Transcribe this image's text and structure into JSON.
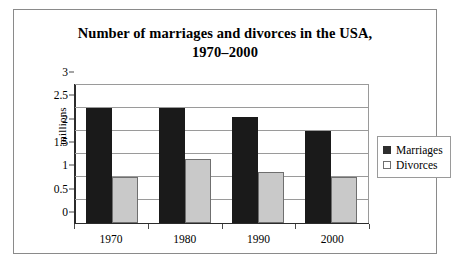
{
  "chart_data": {
    "type": "bar",
    "title": "Number of marriages and divorces in the USA, 1970–2000",
    "title_lines": [
      "Number of marriages and divorces in the USA,",
      "1970–2000"
    ],
    "categories": [
      "1970",
      "1980",
      "1990",
      "2000"
    ],
    "series": [
      {
        "name": "Marriages",
        "values": [
          2.5,
          2.5,
          2.3,
          2.0
        ],
        "color": "#1a1a1a"
      },
      {
        "name": "Divorces",
        "values": [
          1.0,
          1.4,
          1.1,
          1.0
        ],
        "color": "#c9c9c9"
      }
    ],
    "xlabel": "",
    "ylabel": "millions",
    "ylim": [
      0,
      3
    ],
    "yticks": [
      "0",
      "0.5",
      "1",
      "1.5",
      "2",
      "2.5",
      "3"
    ],
    "ytick_values": [
      0,
      0.5,
      1,
      1.5,
      2,
      2.5,
      3
    ],
    "grid": true,
    "legend_position": "right"
  },
  "legend": {
    "entries": [
      {
        "label": "Marriages"
      },
      {
        "label": "Divorces"
      }
    ]
  }
}
